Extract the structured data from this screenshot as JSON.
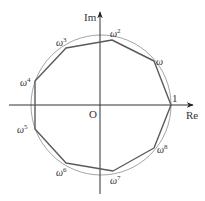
{
  "figure": {
    "axes": {
      "x_label": "Re",
      "y_label": "Im",
      "origin_label": "O"
    },
    "circle": {
      "cx": 101,
      "cy": 105,
      "r": 70,
      "color": "#999999"
    },
    "polygon": {
      "color": "#555555"
    },
    "axis_color": "#333333",
    "vertices": [
      {
        "name": "1",
        "base": "1",
        "sup": "",
        "x": 171,
        "y": 105
      },
      {
        "name": "w1",
        "base": "ω",
        "sup": "",
        "x": 154,
        "y": 61
      },
      {
        "name": "w2",
        "base": "ω",
        "sup": "2",
        "x": 112,
        "y": 40
      },
      {
        "name": "w3",
        "base": "ω",
        "sup": "3",
        "x": 66,
        "y": 48
      },
      {
        "name": "w4",
        "base": "ω",
        "sup": "4",
        "x": 35,
        "y": 81
      },
      {
        "name": "w5",
        "base": "ω",
        "sup": "5",
        "x": 35,
        "y": 129
      },
      {
        "name": "w6",
        "base": "ω",
        "sup": "6",
        "x": 66,
        "y": 163
      },
      {
        "name": "w7",
        "base": "ω",
        "sup": "7",
        "x": 113,
        "y": 171
      },
      {
        "name": "w8",
        "base": "ω",
        "sup": "8",
        "x": 154,
        "y": 148
      }
    ]
  }
}
